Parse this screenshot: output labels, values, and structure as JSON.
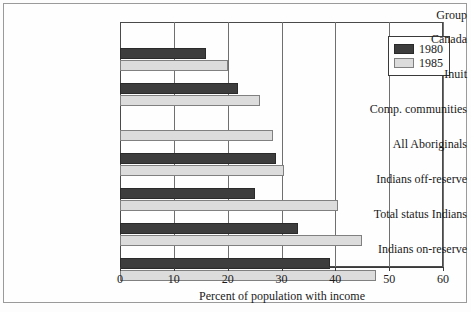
{
  "figure": {
    "group_header": "Group"
  },
  "legend": {
    "entries": [
      {
        "label": "1980",
        "series": "1980",
        "color": "#3d3d3d"
      },
      {
        "label": "1985",
        "series": "1985",
        "color": "#dcdcdc"
      }
    ]
  },
  "chart_data": {
    "type": "bar",
    "orientation": "horizontal",
    "title": "",
    "xlabel": "Percent of population with income",
    "ylabel": "Group",
    "xlim": [
      0,
      60
    ],
    "xticks": [
      0,
      10,
      20,
      30,
      40,
      50,
      60
    ],
    "xtick_labels": [
      "0",
      "10",
      "20",
      "30",
      "40",
      "50",
      "60"
    ],
    "grid": true,
    "grid_axis": "x",
    "legend_position": "top-right",
    "categories": [
      "Canada",
      "Inuit",
      "Comp. communities",
      "All Aboriginals",
      "Indians off-reserve",
      "Total status Indians",
      "Indians on-reserve"
    ],
    "series": [
      {
        "name": "1980",
        "color": "#3d3d3d",
        "values": [
          16,
          22,
          null,
          29,
          25,
          33,
          39
        ]
      },
      {
        "name": "1985",
        "color": "#dcdcdc",
        "values": [
          20,
          26,
          28.5,
          30.5,
          40.5,
          45,
          47.5
        ]
      }
    ]
  }
}
